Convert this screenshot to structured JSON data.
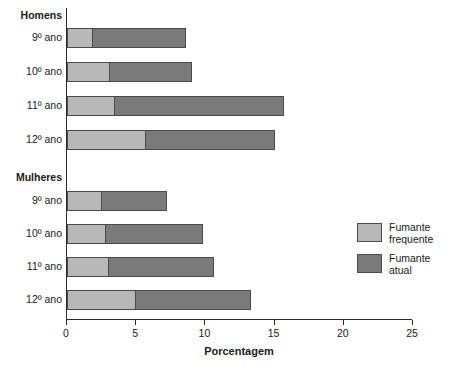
{
  "chart_data": {
    "type": "bar",
    "orientation": "horizontal",
    "stacked": true,
    "title": "",
    "xlabel": "Porcentagem",
    "ylabel": "",
    "xlim": [
      0,
      25
    ],
    "xticks": [
      0,
      5,
      10,
      15,
      20,
      25
    ],
    "xtick_labels": [
      "0",
      "5",
      "10",
      "15",
      "20",
      "25"
    ],
    "grid": false,
    "legend_position": "right",
    "colors": {
      "fumante_frequente": "#b8b8b8",
      "fumante_atual": "#7a7a7a",
      "axis": "#2b2b2b",
      "outline": "#4a4a4a"
    },
    "legend": [
      {
        "label": "Fumante\nfrequente",
        "color": "#b8b8b8"
      },
      {
        "label": "Fumante\natual",
        "color": "#7a7a7a"
      }
    ],
    "series": [
      {
        "name": "Fumante frequente",
        "values": [
          1.9,
          3.1,
          3.5,
          5.7,
          2.5,
          2.8,
          3.0,
          5.0
        ]
      },
      {
        "name": "Fumante atual",
        "values": [
          6.7,
          5.9,
          12.2,
          9.3,
          4.7,
          7.0,
          7.6,
          8.3
        ]
      }
    ],
    "categories": [
      "9º ano",
      "10º ano",
      "11º ano",
      "12º ano",
      "9º ano",
      "10º ano",
      "11º ano",
      "12º ano"
    ],
    "totals": [
      8.6,
      9.0,
      15.7,
      15.0,
      7.2,
      9.8,
      10.6,
      13.3
    ],
    "groups": [
      {
        "label": "Homens",
        "rows": [
          {
            "category": "9º ano",
            "fumante_frequente": 1.9,
            "fumante_atual": 6.7,
            "total": 8.6
          },
          {
            "category": "10º ano",
            "fumante_frequente": 3.1,
            "fumante_atual": 5.9,
            "total": 9.0
          },
          {
            "category": "11º ano",
            "fumante_frequente": 3.5,
            "fumante_atual": 12.2,
            "total": 15.7
          },
          {
            "category": "12º ano",
            "fumante_frequente": 5.7,
            "fumante_atual": 9.3,
            "total": 15.0
          }
        ]
      },
      {
        "label": "Mulheres",
        "rows": [
          {
            "category": "9º ano",
            "fumante_frequente": 2.5,
            "fumante_atual": 4.7,
            "total": 7.2
          },
          {
            "category": "10º ano",
            "fumante_frequente": 2.8,
            "fumante_atual": 7.0,
            "total": 9.8
          },
          {
            "category": "11º ano",
            "fumante_frequente": 3.0,
            "fumante_atual": 7.6,
            "total": 10.6
          },
          {
            "category": "12º ano",
            "fumante_frequente": 5.0,
            "fumante_atual": 8.3,
            "total": 13.3
          }
        ]
      }
    ]
  },
  "labels": {
    "group_homens": "Homens",
    "group_mulheres": "Mulheres",
    "axis_title": "Porcentagem",
    "legend_freq": "Fumante\nfrequente",
    "legend_atual": "Fumante\natual"
  }
}
